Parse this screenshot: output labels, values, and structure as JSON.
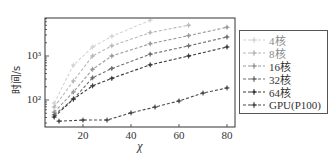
{
  "chart_data": {
    "type": "line",
    "title": "",
    "xlabel": "χ",
    "ylabel": "时间/s",
    "yscale": "log",
    "xlim": [
      4,
      84
    ],
    "ylim": [
      25,
      5500
    ],
    "xticks": [
      20,
      40,
      60,
      80
    ],
    "xtick_labels": [
      "20",
      "40",
      "60",
      "80"
    ],
    "yticks": [
      100,
      1000
    ],
    "ytick_labels": [
      "10²",
      "10³"
    ],
    "grid": false,
    "legend_position": "right-outside",
    "series": [
      {
        "name": "4核",
        "color": "#d4d4d4",
        "x": [
          8,
          16,
          24,
          32,
          48
        ],
        "values": [
          85,
          620,
          1600,
          2800,
          6500
        ]
      },
      {
        "name": "8核",
        "color": "#b8b8b8",
        "x": [
          8,
          16,
          24,
          32,
          48,
          64
        ],
        "values": [
          69,
          270,
          1000,
          1700,
          3400,
          5000
        ]
      },
      {
        "name": "16核",
        "color": "#999999",
        "x": [
          8,
          16,
          24,
          32,
          48,
          64,
          80
        ],
        "values": [
          53,
          152,
          500,
          1000,
          1900,
          2900,
          4500
        ]
      },
      {
        "name": "32核",
        "color": "#6e6e6e",
        "x": [
          8,
          16,
          24,
          32,
          48,
          64,
          80
        ],
        "values": [
          46,
          105,
          320,
          520,
          1100,
          1700,
          2700
        ]
      },
      {
        "name": "64核",
        "color": "#3a3a3a",
        "x": [
          8,
          16,
          24,
          32,
          48,
          64,
          80
        ],
        "values": [
          41,
          105,
          210,
          310,
          630,
          1000,
          1600
        ]
      },
      {
        "name": "GPU(P100)",
        "color": "#4a4a4a",
        "x": [
          10,
          20,
          30,
          40,
          50,
          60,
          70,
          80
        ],
        "values": [
          33,
          35,
          35,
          51,
          69,
          95,
          144,
          188
        ]
      }
    ]
  },
  "legend": {
    "items": [
      {
        "label": "4核"
      },
      {
        "label": "8核"
      },
      {
        "label": "16核"
      },
      {
        "label": "32核"
      },
      {
        "label": "64核"
      },
      {
        "label": "GPU(P100)"
      }
    ]
  }
}
